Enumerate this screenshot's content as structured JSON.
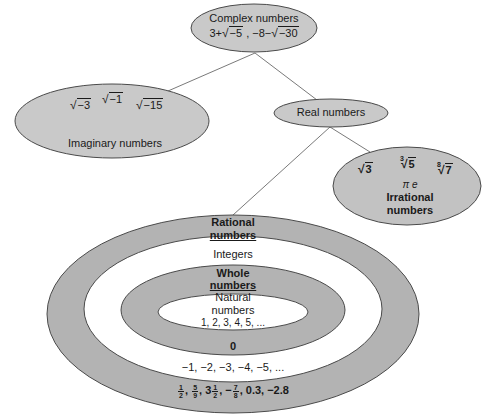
{
  "colors": {
    "node_fill": "#c9c9c9",
    "ring_gray": "#b3b3b3",
    "ring_white": "#ffffff",
    "stroke": "#4a4a4a",
    "line": "#7a7a7a",
    "text": "#1a1a1a"
  },
  "complex": {
    "title": "Complex numbers",
    "examples": [
      {
        "prefix": "3+",
        "radicand": "−5",
        "suffix": " ,"
      },
      {
        "prefix": "−8−",
        "radicand": "−30",
        "suffix": ""
      }
    ]
  },
  "imaginary": {
    "title": "Imaginary numbers",
    "examples": [
      {
        "radicand": "−3"
      },
      {
        "radicand": "−1"
      },
      {
        "radicand": "−15"
      }
    ]
  },
  "real": {
    "title": "Real numbers"
  },
  "irrational": {
    "title_line1": "Irrational",
    "title_line2": "numbers",
    "examples": [
      {
        "index": "",
        "radicand": "3"
      },
      {
        "index": "3",
        "radicand": "5"
      },
      {
        "index": "8",
        "radicand": "7"
      }
    ],
    "constants": "π  e"
  },
  "rational": {
    "title_line1": "Rational",
    "title_line2": "numbers",
    "examples": {
      "f1_num": "1",
      "f1_den": "2",
      "f2_num": "5",
      "f2_den": "9",
      "mixed_whole": "3",
      "f3_num": "1",
      "f3_den": "2",
      "neg": "−",
      "f4_num": "7",
      "f4_den": "8",
      "tail": "0.3, −2.8"
    }
  },
  "integers": {
    "title": "Integers",
    "examples": "−1, −2, −3, −4, −5, ..."
  },
  "whole": {
    "title_line1": "Whole",
    "title_line2": "numbers",
    "examples": "0"
  },
  "natural": {
    "title_line1": "Natural",
    "title_line2": "numbers",
    "examples": "1, 2, 3, 4, 5, ..."
  }
}
